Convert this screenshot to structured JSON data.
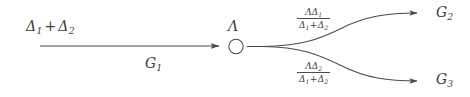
{
  "diagram": {
    "type": "branching-flow-diagram",
    "background_color": "#ffffff",
    "stroke_color": "#4a4a4a",
    "text_color": "#3d3d3d",
    "source": {
      "label_parts": {
        "delta": "Δ",
        "sub1": "1",
        "plus": "+",
        "delta2": "Δ",
        "sub2": "2"
      },
      "label_text": "Δ1 + Δ2"
    },
    "main_edge": {
      "label_symbol": "G",
      "label_subscript": "1",
      "label_text": "G1",
      "direction": "left-to-right",
      "arrowhead": true
    },
    "node": {
      "label_symbol": "Λ",
      "shape": "circle",
      "fill": "none",
      "radius_px": 7
    },
    "branches": [
      {
        "id": "upper",
        "target_symbol": "G",
        "target_subscript": "2",
        "target_text": "G2",
        "rate_numerator_lambda": "Λ",
        "rate_numerator_delta": "Δ",
        "rate_numerator_sub": "1",
        "rate_denominator_delta1": "Δ",
        "rate_denominator_sub1": "1",
        "rate_denominator_plus": "+",
        "rate_denominator_delta2": "Δ",
        "rate_denominator_sub2": "2",
        "rate_text": "ΛΔ1 / (Δ1 + Δ2)",
        "arrowhead": true
      },
      {
        "id": "lower",
        "target_symbol": "G",
        "target_subscript": "3",
        "target_text": "G3",
        "rate_numerator_lambda": "Λ",
        "rate_numerator_delta": "Δ",
        "rate_numerator_sub": "2",
        "rate_denominator_delta1": "Δ",
        "rate_denominator_sub1": "1",
        "rate_denominator_plus": "+",
        "rate_denominator_delta2": "Δ",
        "rate_denominator_sub2": "2",
        "rate_text": "ΛΔ2 / (Δ1 + Δ2)",
        "arrowhead": true
      }
    ]
  }
}
